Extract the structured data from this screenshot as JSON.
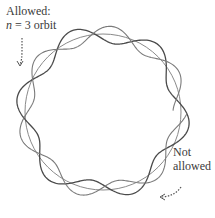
{
  "labels": {
    "allowed_line1": "Allowed:",
    "allowed_n": "n",
    "allowed_rest": " = 3 orbit",
    "not_allowed_line1": "Not",
    "not_allowed_line2": "allowed"
  },
  "colors": {
    "circle": "#8a8a8a",
    "allowed_wave": "#4a4a4a",
    "not_allowed_wave": "#7a7a7a",
    "arrow": "#555555"
  },
  "geometry": {
    "center": [
      103,
      112
    ],
    "radius": 78,
    "allowed_wave": {
      "lobes": 6,
      "amplitude": 9,
      "closed": true
    },
    "not_allowed_wave": {
      "lobes": 6.4,
      "amplitude": 8,
      "closed": false
    }
  }
}
